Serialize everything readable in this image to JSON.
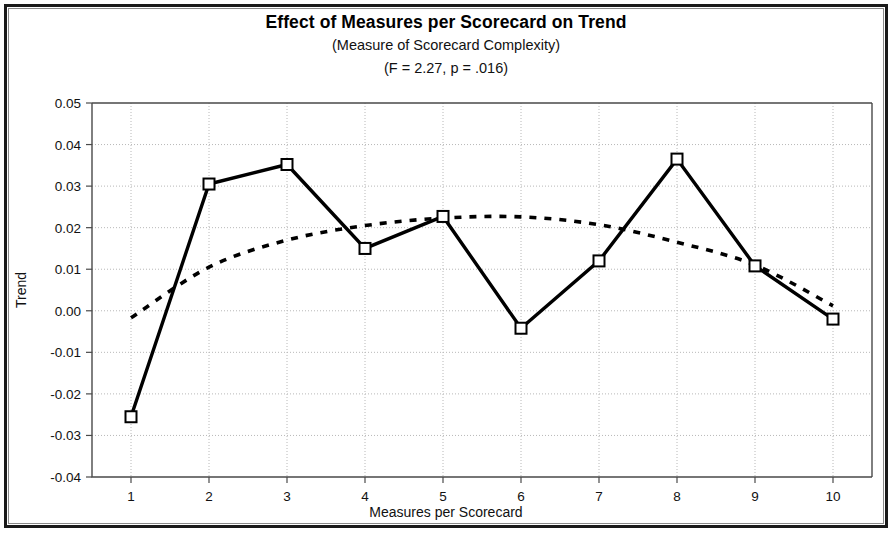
{
  "figure": {
    "title": "Effect of Measures per Scorecard on Trend",
    "subtitle": "(Measure of Scorecard Complexity)",
    "statistics": "(F = 2.27, p = .016)"
  },
  "axes": {
    "x_title": "Measures per Scorecard",
    "y_title": "Trend",
    "x_ticks": [
      "1",
      "2",
      "3",
      "4",
      "5",
      "6",
      "7",
      "8",
      "9",
      "10"
    ],
    "y_ticks": [
      "0.05",
      "0.04",
      "0.03",
      "0.02",
      "0.01",
      "0.00",
      "-0.01",
      "-0.02",
      "-0.03",
      "-0.04"
    ]
  },
  "colors": {
    "line": "#000000",
    "grid": "#b8b8b8",
    "axis": "#4a4a4a",
    "frame": "#1a1a1a",
    "background": "#ffffff"
  },
  "chart_data": {
    "type": "line",
    "title": "Effect of Measures per Scorecard on Trend",
    "subtitle": "(Measure of Scorecard Complexity)",
    "annotation": "(F = 2.27, p = .016)",
    "xlabel": "Measures per Scorecard",
    "ylabel": "Trend",
    "x": [
      1,
      2,
      3,
      4,
      5,
      6,
      7,
      8,
      9,
      10
    ],
    "xlim": [
      0.5,
      10.5
    ],
    "ylim": [
      -0.04,
      0.05
    ],
    "ytick_step": 0.01,
    "grid": true,
    "legend": "none",
    "series": [
      {
        "name": "Observed trend",
        "style": "solid",
        "marker": "open-square",
        "values": [
          -0.0255,
          0.0305,
          0.0352,
          0.015,
          0.0227,
          -0.0042,
          0.012,
          0.0365,
          0.0108,
          -0.002
        ]
      },
      {
        "name": "Fitted quadratic trend",
        "style": "dotted",
        "marker": "none",
        "values": [
          -0.0017,
          0.0105,
          0.017,
          0.0205,
          0.0223,
          0.0226,
          0.0207,
          0.0165,
          0.011,
          0.0012
        ]
      }
    ]
  }
}
